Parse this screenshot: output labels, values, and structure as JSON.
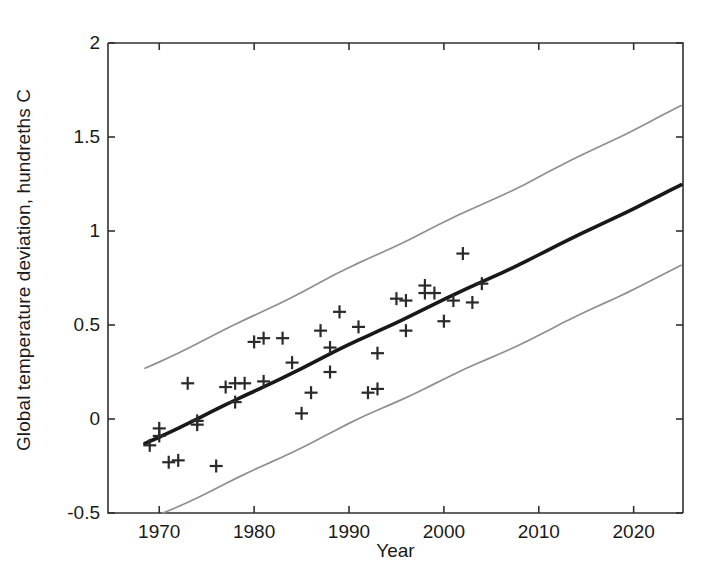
{
  "chart_data": {
    "type": "scatter",
    "title": "",
    "xlabel": "Year",
    "ylabel": "Global temperature deviation, hundreths C",
    "xlim": [
      1964.6,
      2025.2
    ],
    "ylim": [
      -0.5,
      2
    ],
    "xticks": [
      1970,
      1980,
      1990,
      2000,
      2010,
      2020
    ],
    "xticklabels": [
      "1970",
      "1980",
      "1990",
      "2000",
      "2010",
      "2020"
    ],
    "yticks": [
      -0.5,
      0,
      0.5,
      1,
      1.5,
      2
    ],
    "yticklabels": [
      "-0.5",
      "0",
      "0.5",
      "1",
      "1.5",
      "2"
    ],
    "grid": false,
    "legend": null,
    "marker": "plus",
    "series": [
      {
        "name": "Observed global temperature deviation",
        "type": "scatter",
        "marker": "+",
        "color": "#2a2a2a",
        "points": [
          [
            1969,
            -0.14
          ],
          [
            1970,
            -0.05
          ],
          [
            1970,
            -0.09
          ],
          [
            1971,
            -0.23
          ],
          [
            1972,
            -0.22
          ],
          [
            1973,
            0.19
          ],
          [
            1974,
            -0.03
          ],
          [
            1974,
            -0.01
          ],
          [
            1976,
            -0.25
          ],
          [
            1977,
            0.17
          ],
          [
            1978,
            0.09
          ],
          [
            1978,
            0.19
          ],
          [
            1979,
            0.19
          ],
          [
            1980,
            0.41
          ],
          [
            1981,
            0.43
          ],
          [
            1981,
            0.2
          ],
          [
            1983,
            0.43
          ],
          [
            1984,
            0.3
          ],
          [
            1985,
            0.03
          ],
          [
            1986,
            0.14
          ],
          [
            1987,
            0.47
          ],
          [
            1988,
            0.38
          ],
          [
            1988,
            0.25
          ],
          [
            1989,
            0.57
          ],
          [
            1991,
            0.49
          ],
          [
            1992,
            0.14
          ],
          [
            1993,
            0.16
          ],
          [
            1993,
            0.35
          ],
          [
            1995,
            0.64
          ],
          [
            1996,
            0.47
          ],
          [
            1996,
            0.63
          ],
          [
            1998,
            0.71
          ],
          [
            1998,
            0.67
          ],
          [
            1999,
            0.67
          ],
          [
            2000,
            0.52
          ],
          [
            2001,
            0.63
          ],
          [
            2002,
            0.88
          ],
          [
            2003,
            0.62
          ],
          [
            2004,
            0.72
          ]
        ]
      },
      {
        "name": "Fitted regression line",
        "type": "line",
        "color": "#181818",
        "linewidth": 3.6,
        "points": [
          [
            1968.5,
            -0.13
          ],
          [
            2025.0,
            1.24
          ]
        ]
      },
      {
        "name": "Upper prediction band",
        "type": "line",
        "color": "#8f8f8f",
        "linewidth": 1.7,
        "points": [
          [
            1968.5,
            0.27
          ],
          [
            2025.0,
            1.66
          ]
        ]
      },
      {
        "name": "Lower prediction band",
        "type": "line",
        "color": "#8f8f8f",
        "linewidth": 1.7,
        "points": [
          [
            1970.4,
            -0.5
          ],
          [
            2025.0,
            0.81
          ]
        ]
      }
    ]
  }
}
